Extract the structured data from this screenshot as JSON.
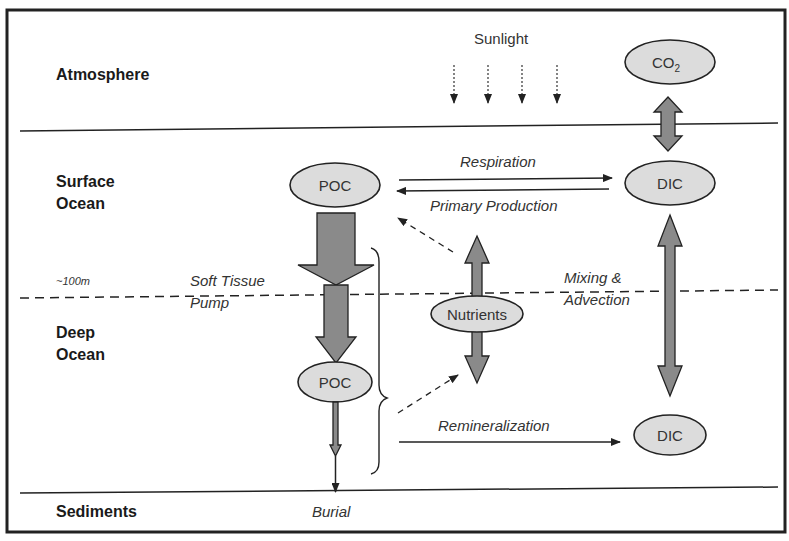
{
  "layers": {
    "atmosphere": "Atmosphere",
    "surface_ocean_1": "Surface",
    "surface_ocean_2": "Ocean",
    "depth_marker": "~100m",
    "deep_ocean_1": "Deep",
    "deep_ocean_2": "Ocean",
    "sediments": "Sediments"
  },
  "nodes": {
    "co2": "CO",
    "co2_sub": "2",
    "poc_surface": "POC",
    "dic_surface": "DIC",
    "nutrients": "Nutrients",
    "poc_deep": "POC",
    "dic_deep": "DIC"
  },
  "labels": {
    "sunlight": "Sunlight",
    "respiration": "Respiration",
    "primary_production": "Primary Production",
    "soft_tissue_1": "Soft Tissue",
    "soft_tissue_2": "Pump",
    "mixing_1": "Mixing &",
    "mixing_2": "Advection",
    "remineralization": "Remineralization",
    "burial": "Burial"
  }
}
